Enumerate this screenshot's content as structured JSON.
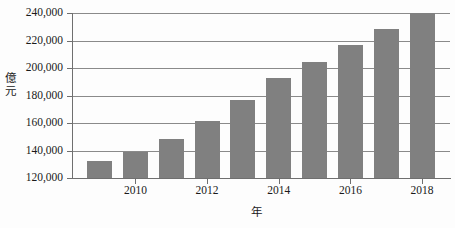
{
  "chart_data": {
    "type": "bar",
    "title": "",
    "subtitle": "",
    "xlabel": "年",
    "ylabel": "億元",
    "ylim": [
      120000,
      240000
    ],
    "ytick_values": [
      120000,
      140000,
      160000,
      180000,
      200000,
      220000,
      240000
    ],
    "ytick_labels": [
      "120,000",
      "140,000",
      "160,000",
      "180,000",
      "200,000",
      "220,000",
      "240,000"
    ],
    "xtick_labels": [
      "2010",
      "2012",
      "2014",
      "2016",
      "2018"
    ],
    "xtick_bar_indices": [
      1,
      3,
      5,
      7,
      9
    ],
    "grid": true,
    "grid_axis": "y",
    "legend": false,
    "bar_color": "#808080",
    "axis_color": "#6f6f6f",
    "gridline_color": "#8a8a8a",
    "categories": [
      "2009",
      "2010",
      "2011",
      "2012",
      "2013",
      "2014",
      "2015",
      "2016",
      "2017",
      "2018"
    ],
    "values": [
      132500,
      139000,
      148500,
      161500,
      177000,
      192500,
      204500,
      217000,
      228500,
      240000
    ]
  },
  "axes": {
    "y_title": "億元",
    "x_title": "年"
  }
}
